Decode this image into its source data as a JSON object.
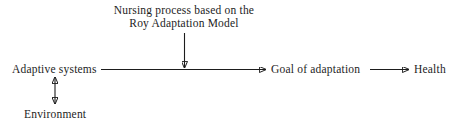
{
  "diagram": {
    "background_color": "#ffffff",
    "line_color": "#1d1d1d",
    "nodes": {
      "adaptive_systems": "Adaptive systems",
      "goal_of_adaptation": "Goal of adaptation",
      "health": "Health",
      "environment": "Environment"
    },
    "caption": {
      "line1": "Nursing process based on the",
      "line2": "Roy Adaptation Model"
    },
    "connectors": {
      "adaptive_to_goal": "arrow-right",
      "goal_to_health": "arrow-right",
      "nursing_process_to_flow": "arrow-down",
      "adaptive_to_environment": "arrow-double-vertical"
    }
  }
}
